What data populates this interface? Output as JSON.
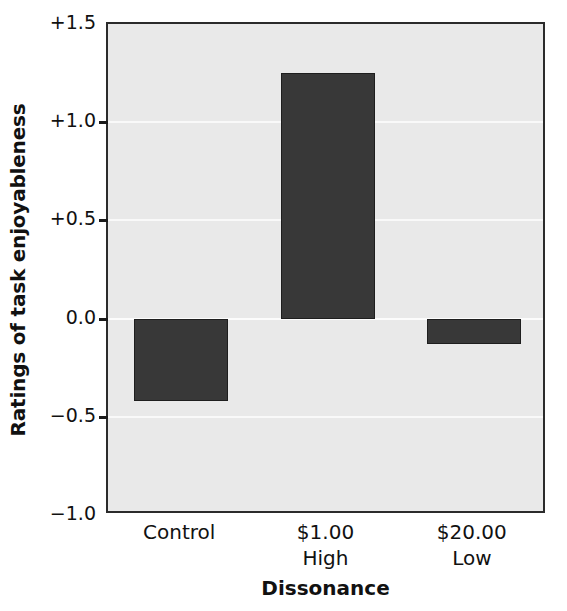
{
  "chart_data": {
    "type": "bar",
    "title": "",
    "xlabel": "Dissonance",
    "ylabel": "Ratings of task enjoyableness",
    "categories": [
      "Control",
      "$1.00",
      "$20.00"
    ],
    "category_sublabels": [
      "",
      "High",
      "Low"
    ],
    "values": [
      -0.42,
      1.25,
      -0.13
    ],
    "ylim": [
      -1.0,
      1.5
    ],
    "yticks": [
      1.5,
      1.0,
      0.5,
      0.0,
      -0.5,
      -1.0
    ],
    "ytick_labels": [
      "+1.5",
      "+1.0",
      "+0.5",
      "0.0",
      "−0.5",
      "−1.0"
    ],
    "grid": true,
    "legend": null,
    "bar_color": "#383838",
    "plot_background": "#e9e9e9",
    "axis_color": "#2b2b2b",
    "gridline_color": "#fbfbfb"
  }
}
